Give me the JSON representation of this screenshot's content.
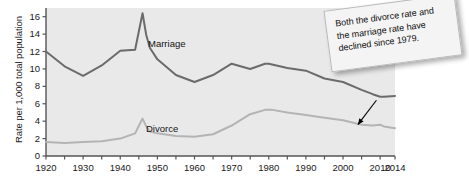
{
  "chart_data": {
    "type": "line",
    "title": "",
    "xlabel": "",
    "ylabel": "Rate per 1,000 total population",
    "xlim": [
      1920,
      2014
    ],
    "ylim": [
      0,
      17
    ],
    "grid": false,
    "legend_position": "inline-labels",
    "y_ticks": [
      0,
      2,
      4,
      6,
      8,
      10,
      12,
      14,
      16
    ],
    "y_tick_labels": [
      "0",
      "2",
      "4",
      "6",
      "8",
      "10",
      "12",
      "14",
      "16"
    ],
    "x_ticks": [
      1920,
      1925,
      1930,
      1935,
      1940,
      1945,
      1950,
      1955,
      1960,
      1965,
      1970,
      1975,
      1980,
      1985,
      1990,
      1995,
      2000,
      2005,
      2010,
      2014
    ],
    "x_tick_labels": [
      "1920",
      "1930",
      "1940",
      "1950",
      "1960",
      "1970",
      "1980",
      "1990",
      "2000",
      "2010",
      "2014"
    ],
    "x_tick_label_values": [
      1920,
      1930,
      1940,
      1950,
      1960,
      1970,
      1980,
      1990,
      2000,
      2010,
      2014
    ],
    "series": [
      {
        "name": "Marriage",
        "color": "#6b6b6b",
        "label_x": 1955,
        "label_y": 13.4,
        "x": [
          1920,
          1925,
          1930,
          1935,
          1940,
          1944,
          1946,
          1947,
          1948,
          1950,
          1955,
          1960,
          1965,
          1970,
          1975,
          1979,
          1980,
          1985,
          1990,
          1995,
          2000,
          2005,
          2008,
          2010,
          2011,
          2014
        ],
        "y": [
          12.0,
          10.3,
          9.2,
          10.4,
          12.1,
          12.2,
          16.4,
          13.9,
          12.4,
          11.1,
          9.3,
          8.5,
          9.3,
          10.6,
          10.0,
          10.6,
          10.6,
          10.1,
          9.8,
          8.9,
          8.5,
          7.6,
          7.1,
          6.8,
          6.8,
          6.9
        ]
      },
      {
        "name": "Divorce",
        "color": "#b4b4b4",
        "label_x": 1953,
        "label_y": 4.3,
        "x": [
          1920,
          1925,
          1930,
          1935,
          1940,
          1944,
          1946,
          1947,
          1948,
          1950,
          1955,
          1960,
          1965,
          1970,
          1975,
          1979,
          1981,
          1985,
          1990,
          1995,
          2000,
          2005,
          2008,
          2010,
          2011,
          2014
        ],
        "y": [
          1.6,
          1.5,
          1.6,
          1.7,
          2.0,
          2.6,
          4.3,
          3.4,
          2.8,
          2.6,
          2.3,
          2.2,
          2.5,
          3.5,
          4.8,
          5.3,
          5.3,
          5.0,
          4.7,
          4.4,
          4.1,
          3.6,
          3.5,
          3.6,
          3.4,
          3.2
        ]
      }
    ],
    "annotations": [
      {
        "name": "decline-note",
        "text": "Both the divorce rate and the marriage rate have declined since 1979.",
        "arrow_from_x": 2009,
        "arrow_from_y": 6.4,
        "arrow_to_x": 2004,
        "arrow_to_y": 3.6
      }
    ],
    "plot_background": "#e9e9e9",
    "axis_color": "#555555"
  }
}
